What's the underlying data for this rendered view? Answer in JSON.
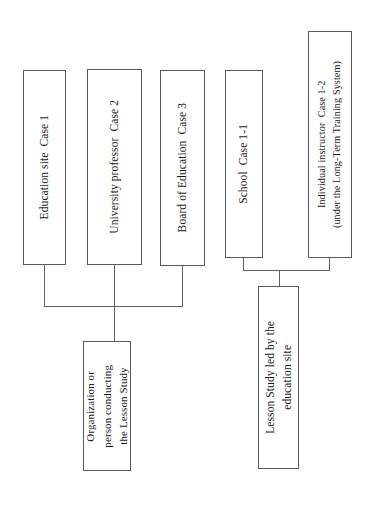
{
  "figure": {
    "orientation": "rotated-90-counter-clockwise",
    "type": "tree-flowchart",
    "background_color": "#ffffff",
    "line_color": "#5b6166",
    "box_border_color": "#555b60",
    "text_color": "#1a1a1a"
  },
  "nodes": {
    "education_site": {
      "label": "Education site  Case 1",
      "case": "Case 1"
    },
    "university_professor": {
      "label": "University professor  Case 2",
      "case": "Case 2"
    },
    "board_of_education": {
      "label": "Board of Education  Case 3",
      "case": "Case 3"
    },
    "school": {
      "label": "School  Case 1-1",
      "case": "Case 1-1"
    },
    "individual_instructor": {
      "label": "Individual instructor  Case 1-2\n(under the Long-Term Training System)",
      "case": "Case 1-2",
      "note": "(under the Long-Term Training System)"
    },
    "organization_or_person": {
      "label": "Organization or\nperson conducting\nthe Lesson Study"
    },
    "lesson_study_led_by_site": {
      "label": "Lesson Study led by the\neducation site"
    }
  },
  "connections": [
    {
      "from": "education_site",
      "to": "organization_or_person"
    },
    {
      "from": "university_professor",
      "to": "organization_or_person"
    },
    {
      "from": "board_of_education",
      "to": "organization_or_person"
    },
    {
      "from": "school",
      "to": "lesson_study_led_by_site"
    },
    {
      "from": "individual_instructor",
      "to": "lesson_study_led_by_site"
    }
  ]
}
